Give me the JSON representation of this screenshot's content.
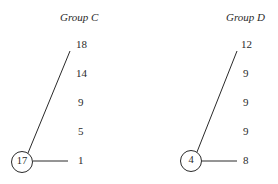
{
  "groups": [
    {
      "title": "Group C",
      "node": "17",
      "values": [
        "18",
        "14",
        "9",
        "5",
        "1"
      ]
    },
    {
      "title": "Group D",
      "node": "4",
      "values": [
        "12",
        "9",
        "9",
        "9",
        "8"
      ]
    }
  ]
}
